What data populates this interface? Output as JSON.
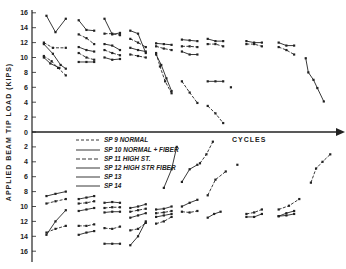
{
  "chart_data": {
    "type": "line",
    "title": "",
    "xlabel": "CYCLES",
    "ylabel": "APPLIED BEAM TIP LOAD (KIPS)",
    "ylim": [
      -16,
      16
    ],
    "y_ticks_upper": [
      "16",
      "14",
      "12",
      "10",
      "8",
      "6",
      "4",
      "2",
      "0"
    ],
    "y_ticks_lower": [
      "2",
      "4",
      "6",
      "8",
      "10",
      "12",
      "14",
      "16"
    ],
    "grid": false,
    "legend_placement": "center-left",
    "legend": [
      {
        "name": "SP 9 NORMAL",
        "marker": "dot-dash"
      },
      {
        "name": "SP 10 NORMAL + FIBER",
        "marker": "tee"
      },
      {
        "name": "SP 11 HIGH ST.",
        "marker": "x"
      },
      {
        "name": "SP 12 HIGH STR FIBER",
        "marker": "bar"
      },
      {
        "name": "SP 13",
        "marker": "dot"
      },
      {
        "name": "SP 14",
        "marker": "dot"
      }
    ],
    "series": [
      {
        "name": "up-g1-a",
        "x": [
          0.5,
          1.2,
          2.0
        ],
        "y": [
          15.6,
          13.4,
          15.2
        ]
      },
      {
        "name": "up-g1-b",
        "x": [
          0.3,
          1.0,
          2.0
        ],
        "y": [
          12.0,
          11.3,
          11.3
        ]
      },
      {
        "name": "up-g1-c",
        "x": [
          0.3,
          1.0,
          1.6,
          2.0
        ],
        "y": [
          11.8,
          10.5,
          9.0,
          8.5
        ]
      },
      {
        "name": "up-g1-d",
        "x": [
          0.3,
          0.9,
          1.4,
          2.0
        ],
        "y": [
          10.2,
          9.5,
          8.6,
          7.6
        ]
      },
      {
        "name": "up-g1-e",
        "x": [
          0.3,
          0.8,
          1.5
        ],
        "y": [
          10.0,
          9.2,
          8.6
        ]
      },
      {
        "name": "up-g2-a",
        "x": [
          3.0,
          3.6,
          4.2
        ],
        "y": [
          15.0,
          13.7,
          13.6
        ]
      },
      {
        "name": "up-g2-b",
        "x": [
          3.0,
          3.6,
          4.2
        ],
        "y": [
          13.1,
          12.6,
          11.8
        ]
      },
      {
        "name": "up-g2-c",
        "x": [
          3.0,
          3.6,
          4.2
        ],
        "y": [
          11.4,
          11.0,
          10.8
        ]
      },
      {
        "name": "up-g2-d",
        "x": [
          3.0,
          3.6,
          4.2
        ],
        "y": [
          10.6,
          10.0,
          9.7
        ]
      },
      {
        "name": "up-g2-e",
        "x": [
          3.0,
          3.6,
          4.2
        ],
        "y": [
          9.4,
          9.4,
          9.4
        ]
      },
      {
        "name": "up-g3-a",
        "x": [
          5.0,
          5.6,
          6.2
        ],
        "y": [
          15.2,
          13.1,
          13.3
        ]
      },
      {
        "name": "up-g3-b",
        "x": [
          5.0,
          5.6,
          6.2
        ],
        "y": [
          13.2,
          13.2,
          13.0
        ]
      },
      {
        "name": "up-g3-c",
        "x": [
          5.0,
          5.6,
          6.2
        ],
        "y": [
          11.8,
          11.6,
          11.0
        ]
      },
      {
        "name": "up-g3-d",
        "x": [
          5.0,
          5.6,
          6.2
        ],
        "y": [
          11.0,
          10.6,
          10.3
        ]
      },
      {
        "name": "up-g3-e",
        "x": [
          5.0,
          5.6,
          6.2
        ],
        "y": [
          10.0,
          9.7,
          9.8
        ]
      },
      {
        "name": "up-g4-a",
        "x": [
          7.0,
          7.6,
          8.2
        ],
        "y": [
          13.6,
          13.2,
          10.6
        ]
      },
      {
        "name": "up-g4-b",
        "x": [
          7.0,
          7.6,
          8.2
        ],
        "y": [
          12.5,
          12.0,
          11.4
        ]
      },
      {
        "name": "up-g4-c",
        "x": [
          7.0,
          7.6,
          8.2
        ],
        "y": [
          11.3,
          11.0,
          10.8
        ]
      },
      {
        "name": "up-g4-d",
        "x": [
          7.0,
          7.6,
          8.2
        ],
        "y": [
          10.4,
          10.2,
          10.0
        ]
      },
      {
        "name": "up-g5-a",
        "x": [
          9.0,
          9.6,
          10.2
        ],
        "y": [
          11.9,
          11.8,
          11.7
        ]
      },
      {
        "name": "up-g5-b",
        "x": [
          9.0,
          9.6,
          10.2
        ],
        "y": [
          11.5,
          11.2,
          11.0
        ]
      },
      {
        "name": "up-g5-c",
        "x": [
          9.0,
          9.4,
          9.8,
          10.2
        ],
        "y": [
          10.4,
          9.0,
          7.2,
          5.5
        ]
      },
      {
        "name": "up-g5-d",
        "x": [
          9.0,
          9.3,
          9.7,
          10.2
        ],
        "y": [
          10.6,
          8.8,
          6.8,
          5.2
        ]
      },
      {
        "name": "up-g6-a",
        "x": [
          11.0,
          11.6,
          12.2
        ],
        "y": [
          12.4,
          12.3,
          12.2
        ]
      },
      {
        "name": "up-g6-b",
        "x": [
          11.0,
          11.6,
          12.2
        ],
        "y": [
          11.5,
          11.5,
          11.4
        ]
      },
      {
        "name": "up-g6-c",
        "x": [
          11.0,
          11.6,
          12.2
        ],
        "y": [
          10.8,
          10.4,
          10.4
        ]
      },
      {
        "name": "up-g6-d",
        "x": [
          11.0,
          11.6,
          12.2
        ],
        "y": [
          6.8,
          5.3,
          3.9
        ]
      },
      {
        "name": "up-g7-a",
        "x": [
          13.0,
          13.6,
          14.2
        ],
        "y": [
          12.5,
          12.2,
          12.2
        ]
      },
      {
        "name": "up-g7-b",
        "x": [
          13.0,
          13.6,
          14.2
        ],
        "y": [
          11.8,
          11.8,
          11.5
        ]
      },
      {
        "name": "up-g7-c",
        "x": [
          13.0,
          13.6,
          14.2
        ],
        "y": [
          6.8,
          6.8,
          6.8
        ]
      },
      {
        "name": "up-g7-d",
        "x": [
          13.0,
          13.6,
          14.2
        ],
        "y": [
          3.5,
          2.5,
          1.2
        ]
      },
      {
        "name": "up-g7-e",
        "x": [
          14.8
        ],
        "y": [
          6.0
        ]
      },
      {
        "name": "up-g8-a",
        "x": [
          16.0,
          16.6,
          17.2
        ],
        "y": [
          12.2,
          12.0,
          12.0
        ]
      },
      {
        "name": "up-g8-b",
        "x": [
          16.0,
          16.6,
          17.2
        ],
        "y": [
          11.8,
          11.8,
          11.5
        ]
      },
      {
        "name": "up-g9-a",
        "x": [
          18.5,
          19.1,
          19.7
        ],
        "y": [
          12.0,
          11.6,
          11.6
        ]
      },
      {
        "name": "up-g9-b",
        "x": [
          18.5,
          19.1,
          19.7
        ],
        "y": [
          11.4,
          11.0,
          10.4
        ]
      },
      {
        "name": "up-g9-c",
        "x": [
          20.6,
          20.8,
          21.2,
          21.5,
          22.0
        ],
        "y": [
          9.9,
          8.0,
          7.0,
          5.9,
          4.1
        ]
      },
      {
        "name": "dn-g1-a",
        "x": [
          0.5,
          1.2,
          2.0
        ],
        "y": [
          -8.6,
          -8.3,
          -8.0
        ]
      },
      {
        "name": "dn-g1-b",
        "x": [
          0.5,
          1.2,
          2.0
        ],
        "y": [
          -9.6,
          -9.3,
          -9.0
        ]
      },
      {
        "name": "dn-g1-c",
        "x": [
          0.5,
          1.2,
          2.0
        ],
        "y": [
          -13.8,
          -12.0,
          -10.5
        ]
      },
      {
        "name": "dn-g1-d",
        "x": [
          0.5,
          1.2,
          2.0
        ],
        "y": [
          -13.5,
          -13.0,
          -12.6
        ]
      },
      {
        "name": "dn-g2-a",
        "x": [
          3.0,
          3.6,
          4.2
        ],
        "y": [
          -9.0,
          -8.8,
          -8.6
        ]
      },
      {
        "name": "dn-g2-b",
        "x": [
          3.0,
          3.6,
          4.2
        ],
        "y": [
          -9.6,
          -9.5,
          -9.3
        ]
      },
      {
        "name": "dn-g2-c",
        "x": [
          3.0,
          3.6,
          4.2
        ],
        "y": [
          -10.6,
          -10.4,
          -10.2
        ]
      },
      {
        "name": "dn-g2-d",
        "x": [
          3.0,
          3.6,
          4.2
        ],
        "y": [
          -12.6,
          -12.6,
          -12.4
        ]
      },
      {
        "name": "dn-g2-e",
        "x": [
          3.0,
          3.6,
          4.2
        ],
        "y": [
          -13.8,
          -13.5,
          -13.3
        ]
      },
      {
        "name": "dn-g3-a",
        "x": [
          5.0,
          5.6,
          6.2
        ],
        "y": [
          -9.5,
          -9.4,
          -9.5
        ]
      },
      {
        "name": "dn-g3-b",
        "x": [
          5.0,
          5.6,
          6.2
        ],
        "y": [
          -10.2,
          -10.1,
          -10.1
        ]
      },
      {
        "name": "dn-g3-c",
        "x": [
          5.0,
          5.6,
          6.2
        ],
        "y": [
          -10.8,
          -10.7,
          -10.7
        ]
      },
      {
        "name": "dn-g3-d",
        "x": [
          5.0,
          5.6,
          6.2
        ],
        "y": [
          -12.9,
          -13.0,
          -12.7
        ]
      },
      {
        "name": "dn-g3-e",
        "x": [
          5.0,
          5.6,
          6.2
        ],
        "y": [
          -15.0,
          -15.0,
          -15.0
        ]
      },
      {
        "name": "dn-g4-a",
        "x": [
          7.0,
          7.6,
          8.2
        ],
        "y": [
          -10.2,
          -10.0,
          -9.7
        ]
      },
      {
        "name": "dn-g4-b",
        "x": [
          7.0,
          7.6,
          8.2
        ],
        "y": [
          -10.7,
          -10.5,
          -10.3
        ]
      },
      {
        "name": "dn-g4-c",
        "x": [
          7.0,
          7.6,
          8.2
        ],
        "y": [
          -11.5,
          -11.2,
          -10.9
        ]
      },
      {
        "name": "dn-g4-d",
        "x": [
          7.0,
          7.6,
          8.2
        ],
        "y": [
          -13.2,
          -13.0,
          -12.2
        ]
      },
      {
        "name": "dn-g4-e",
        "x": [
          7.0,
          7.6,
          8.2
        ],
        "y": [
          -15.2,
          -14.0,
          -12.0
        ]
      },
      {
        "name": "dn-g5-a",
        "x": [
          9.0,
          9.6,
          10.2
        ],
        "y": [
          -10.4,
          -10.3,
          -10.0
        ]
      },
      {
        "name": "dn-g5-b",
        "x": [
          9.0,
          9.6,
          10.2
        ],
        "y": [
          -10.9,
          -10.8,
          -10.6
        ]
      },
      {
        "name": "dn-g5-c",
        "x": [
          9.0,
          9.6,
          10.2
        ],
        "y": [
          -11.4,
          -11.2,
          -11.0
        ]
      },
      {
        "name": "dn-g5-d",
        "x": [
          9.0,
          9.6,
          10.2
        ],
        "y": [
          -12.3,
          -12.0,
          -11.4
        ]
      },
      {
        "name": "dn-g5-e",
        "x": [
          9.6,
          10.2,
          10.6
        ],
        "y": [
          -7.5,
          -5.0,
          -2.0
        ]
      },
      {
        "name": "dn-g6-a",
        "x": [
          11.0,
          11.6,
          12.2
        ],
        "y": [
          -10.0,
          -9.5,
          -9.1
        ]
      },
      {
        "name": "dn-g6-b",
        "x": [
          11.0,
          11.6,
          12.2
        ],
        "y": [
          -10.7,
          -10.8,
          -10.6
        ]
      },
      {
        "name": "dn-g6-c",
        "x": [
          11.0,
          11.6,
          12.2
        ],
        "y": [
          -6.7,
          -5.0,
          -4.4
        ]
      },
      {
        "name": "dn-g6-d",
        "x": [
          12.4,
          12.9,
          13.4
        ],
        "y": [
          -4.2,
          -3.0,
          -1.3
        ]
      },
      {
        "name": "dn-g7-a",
        "x": [
          13.0,
          13.5,
          14.0
        ],
        "y": [
          -11.5,
          -11.0,
          -10.7
        ]
      },
      {
        "name": "dn-g7-b",
        "x": [
          13.0,
          13.6,
          14.4
        ],
        "y": [
          -8.5,
          -6.4,
          -5.3
        ]
      },
      {
        "name": "dn-g7-c",
        "x": [
          15.3
        ],
        "y": [
          -4.4
        ]
      },
      {
        "name": "dn-g8-a",
        "x": [
          16.0,
          16.6,
          17.2
        ],
        "y": [
          -11.4,
          -11.4,
          -11.0
        ]
      },
      {
        "name": "dn-g8-b",
        "x": [
          16.0,
          16.6,
          17.2
        ],
        "y": [
          -11.0,
          -10.8,
          -10.4
        ]
      },
      {
        "name": "dn-g9-a",
        "x": [
          18.5,
          19.1,
          19.7
        ],
        "y": [
          -11.3,
          -10.9,
          -10.6
        ]
      },
      {
        "name": "dn-g9-b",
        "x": [
          18.5,
          19.3,
          20.1
        ],
        "y": [
          -10.4,
          -9.9,
          -9.0
        ]
      },
      {
        "name": "dn-g9-c",
        "x": [
          18.5,
          19.1,
          19.7
        ],
        "y": [
          -11.3,
          -11.2,
          -11.0
        ]
      },
      {
        "name": "dn-g9-d",
        "x": [
          21.0,
          21.4,
          21.9,
          22.5
        ],
        "y": [
          -6.8,
          -4.9,
          -4.0,
          -3.0
        ]
      }
    ]
  },
  "annotations": {
    "legend_label_1": "SP  9  NORMAL",
    "legend_label_2": "SP  10  NORMAL + FIBER",
    "legend_label_3": "SP  11  HIGH  ST.",
    "legend_label_4": "SP  12  HIGH  STR FIBER",
    "legend_label_5": "SP  13",
    "legend_label_6": "SP  14"
  }
}
